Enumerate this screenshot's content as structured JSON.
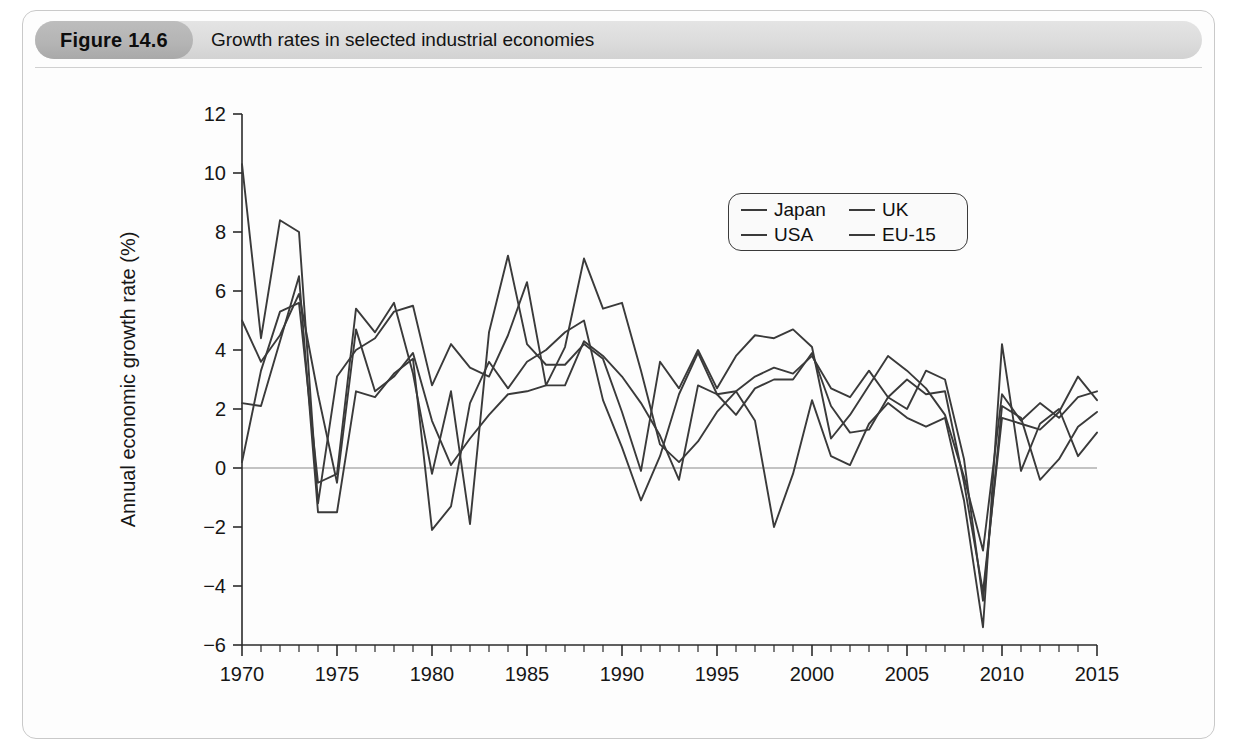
{
  "figure": {
    "number_label": "Figure 14.6",
    "caption": "Growth rates in selected industrial economies"
  },
  "legend": {
    "position": "top-right-inside",
    "entries": [
      {
        "label": "Japan",
        "swatch": "line-swatch-icon"
      },
      {
        "label": "UK",
        "swatch": "line-swatch-icon"
      },
      {
        "label": "USA",
        "swatch": "line-swatch-icon"
      },
      {
        "label": "EU-15",
        "swatch": "line-swatch-icon"
      }
    ]
  },
  "axes": {
    "y_title": "Annual economic growth rate (%)",
    "y_ticks": [
      "-6",
      "-4",
      "-2",
      "0",
      "2",
      "4",
      "6",
      "8",
      "10",
      "12"
    ],
    "x_ticks": [
      "1970",
      "1975",
      "1980",
      "1985",
      "1990",
      "1995",
      "2000",
      "2005",
      "2010",
      "2015"
    ]
  },
  "chart_data": {
    "type": "line",
    "title": "Growth rates in selected industrial economies",
    "xlabel": "",
    "ylabel": "Annual economic growth rate (%)",
    "xlim": [
      1970,
      2015
    ],
    "ylim": [
      -6,
      12
    ],
    "y_tick_step": 2,
    "x_tick_step": 5,
    "x_minor_tick_step": 1,
    "grid": false,
    "zero_line": true,
    "legend_position": "upper right inside plot",
    "line_color": "#3a3a3a",
    "x": [
      1970,
      1971,
      1972,
      1973,
      1974,
      1975,
      1976,
      1977,
      1978,
      1979,
      1980,
      1981,
      1982,
      1983,
      1984,
      1985,
      1986,
      1987,
      1988,
      1989,
      1990,
      1991,
      1992,
      1993,
      1994,
      1995,
      1996,
      1997,
      1998,
      1999,
      2000,
      2001,
      2002,
      2003,
      2004,
      2005,
      2006,
      2007,
      2008,
      2009,
      2010,
      2011,
      2012,
      2013,
      2014,
      2015
    ],
    "series": [
      {
        "name": "Japan",
        "values": [
          10.3,
          4.4,
          8.4,
          8.0,
          -1.2,
          3.1,
          4.0,
          4.4,
          5.3,
          5.5,
          2.8,
          4.2,
          3.4,
          3.1,
          4.5,
          6.3,
          2.8,
          4.1,
          7.1,
          5.4,
          5.6,
          3.3,
          0.8,
          0.2,
          0.9,
          1.9,
          2.6,
          1.6,
          -2.0,
          -0.2,
          2.3,
          0.4,
          0.1,
          1.5,
          2.2,
          1.7,
          1.4,
          1.7,
          -1.1,
          -5.4,
          4.2,
          -0.1,
          1.5,
          2.0,
          0.4,
          1.2
        ]
      },
      {
        "name": "USA",
        "values": [
          0.2,
          3.3,
          5.3,
          5.6,
          -0.5,
          -0.2,
          5.4,
          4.6,
          5.6,
          3.2,
          -0.2,
          2.6,
          -1.9,
          4.6,
          7.2,
          4.2,
          3.5,
          3.5,
          4.2,
          3.7,
          1.9,
          -0.1,
          3.6,
          2.7,
          4.0,
          2.7,
          3.8,
          4.5,
          4.4,
          4.7,
          4.1,
          1.0,
          1.8,
          2.8,
          3.8,
          3.3,
          2.7,
          1.8,
          -0.3,
          -2.8,
          2.5,
          1.6,
          2.2,
          1.7,
          2.4,
          2.6
        ]
      },
      {
        "name": "UK",
        "values": [
          2.2,
          2.1,
          4.3,
          6.5,
          -1.5,
          -1.5,
          2.6,
          2.4,
          3.2,
          3.7,
          -2.1,
          -1.3,
          2.2,
          3.6,
          2.7,
          3.6,
          4.0,
          4.6,
          5.0,
          2.3,
          0.7,
          -1.1,
          0.4,
          2.5,
          3.9,
          2.5,
          2.6,
          3.1,
          3.4,
          3.2,
          3.8,
          2.7,
          2.4,
          3.3,
          2.4,
          3.0,
          2.5,
          2.6,
          -0.5,
          -4.2,
          1.7,
          1.5,
          1.3,
          1.9,
          3.1,
          2.3
        ]
      },
      {
        "name": "EU-15",
        "values": [
          5.0,
          3.6,
          4.5,
          5.9,
          2.5,
          -0.5,
          4.7,
          2.6,
          3.1,
          3.9,
          1.6,
          0.1,
          1.0,
          1.8,
          2.5,
          2.6,
          2.8,
          2.8,
          4.3,
          3.8,
          3.1,
          2.2,
          1.1,
          -0.4,
          2.8,
          2.5,
          1.8,
          2.7,
          3.0,
          3.0,
          3.9,
          2.1,
          1.2,
          1.3,
          2.4,
          2.0,
          3.3,
          3.0,
          0.3,
          -4.5,
          2.1,
          1.7,
          -0.4,
          0.3,
          1.4,
          1.9
        ]
      }
    ]
  }
}
